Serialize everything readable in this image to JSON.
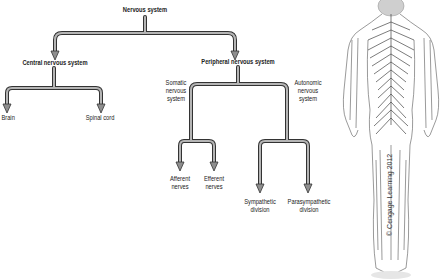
{
  "title": "Nervous system",
  "nodes": {
    "root": "Nervous system",
    "cns": "Central nervous system",
    "brain": "Brain",
    "spinal_cord": "Spinal cord",
    "pns": "Peripheral nervous system",
    "somatic_1": "Somatic",
    "somatic_2": "nervous",
    "somatic_3": "system",
    "autonomic_1": "Autonomic",
    "autonomic_2": "nervous",
    "autonomic_3": "system",
    "afferent_1": "Afferent",
    "afferent_2": "nerves",
    "efferent_1": "Efferent",
    "efferent_2": "nerves",
    "sympathetic_1": "Sympathetic",
    "sympathetic_2": "division",
    "parasympathetic_1": "Parasympathetic",
    "parasympathetic_2": "division"
  },
  "credit": "© Cengage Learning 2012",
  "illustration": "human-nervous-system-back-view",
  "colors": {
    "arrow_fill": "#9a9a9a",
    "arrow_stroke": "#333333",
    "text": "#222222"
  }
}
